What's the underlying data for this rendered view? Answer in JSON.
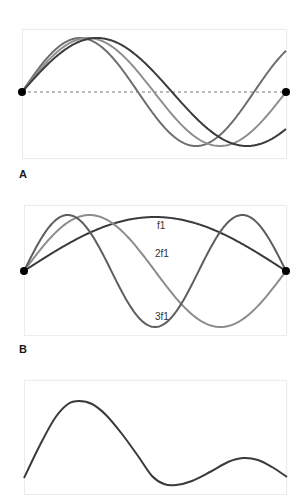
{
  "figure": {
    "panels": [
      {
        "id": "A",
        "label": "A",
        "box": {
          "x": 22,
          "y": 29,
          "w": 265,
          "h": 130
        },
        "baseline_y": 92,
        "baseline_style": "dashed",
        "endpoints": [
          {
            "x": 22,
            "y": 92
          },
          {
            "x": 286,
            "y": 92
          }
        ],
        "curves": [
          {
            "name": "wave-fast",
            "color": "#6e6e6e",
            "x0": 22,
            "x1": 286,
            "amplitude": 54,
            "wavelength": 232
          },
          {
            "name": "wave-mid",
            "color": "#8f8f8f",
            "x0": 22,
            "x1": 286,
            "amplitude": 54,
            "wavelength": 264
          },
          {
            "name": "wave-slow",
            "color": "#3c3c3c",
            "x0": 22,
            "x1": 286,
            "amplitude": 54,
            "wavelength": 300
          }
        ]
      },
      {
        "id": "B",
        "label": "B",
        "box": {
          "x": 24,
          "y": 205,
          "w": 263,
          "h": 131
        },
        "baseline_y": 271,
        "endpoints": [
          {
            "x": 24,
            "y": 271
          },
          {
            "x": 286,
            "y": 271
          }
        ],
        "curves": [
          {
            "name": "harmonic-f1",
            "label": "f1",
            "color": "#3a3a3a",
            "harmonic": 1,
            "amplitude": 54,
            "label_pos": {
              "x": 157,
              "y": 229
            }
          },
          {
            "name": "harmonic-2f1",
            "label": "2f1",
            "color": "#8c8c8c",
            "harmonic": 2,
            "amplitude": 56,
            "label_pos": {
              "x": 155,
              "y": 257
            }
          },
          {
            "name": "harmonic-3f1",
            "label": "3f1",
            "color": "#5e5e5e",
            "harmonic": 3,
            "amplitude": 56,
            "label_pos": {
              "x": 155,
              "y": 320
            }
          }
        ]
      },
      {
        "id": "C",
        "box": {
          "x": 24,
          "y": 380,
          "w": 263,
          "h": 111
        },
        "curves": [
          {
            "name": "complex-wave",
            "color": "#3a3a3a",
            "points": [
              [
                24,
                478
              ],
              [
                40,
                445
              ],
              [
                55,
                418
              ],
              [
                68,
                404
              ],
              [
                79,
                401
              ],
              [
                92,
                404
              ],
              [
                106,
                415
              ],
              [
                122,
                434
              ],
              [
                138,
                456
              ],
              [
                152,
                476
              ],
              [
                164,
                484
              ],
              [
                176,
                485
              ],
              [
                192,
                481
              ],
              [
                210,
                472
              ],
              [
                228,
                462
              ],
              [
                243,
                458
              ],
              [
                258,
                460
              ],
              [
                272,
                467
              ],
              [
                287,
                477
              ]
            ]
          }
        ]
      }
    ],
    "labels": {
      "A": "A",
      "B": "B"
    }
  }
}
